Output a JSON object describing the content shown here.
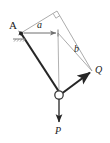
{
  "figure": {
    "type": "statics-free-body-diagram",
    "title": "",
    "colors": {
      "link_dark": "#262626",
      "construction_light": "#9a9a9a",
      "dimension_line": "#8c8c8c",
      "label_text": "#1a1a1a",
      "background": "#ffffff"
    },
    "labels": {
      "support_point": "A",
      "dimension_horizontal": "a",
      "dimension_diagonal": "b",
      "force_right": "Q",
      "force_down": "P"
    },
    "nodes": [
      {
        "name": "support-A",
        "label": "A",
        "x": 21,
        "y": 33
      },
      {
        "name": "top-vertex",
        "label": "",
        "x": 57,
        "y": 11
      },
      {
        "name": "right-vertex",
        "label": "Q",
        "x": 92,
        "y": 71
      },
      {
        "name": "pin-joint",
        "label": "",
        "x": 59,
        "y": 95
      },
      {
        "name": "corner-inner",
        "label": "",
        "x": 58,
        "y": 33
      },
      {
        "name": "force-P-tip",
        "label": "P",
        "x": 59,
        "y": 125
      }
    ],
    "members": [
      {
        "name": "link-A-to-joint",
        "from": "support-A",
        "to": "pin-joint",
        "style": "heavy"
      },
      {
        "name": "link-joint-to-Q",
        "from": "pin-joint",
        "to": "right-vertex",
        "style": "heavy-arrow"
      },
      {
        "name": "construction-A-to-top",
        "from": "support-A",
        "to": "top-vertex",
        "style": "light"
      },
      {
        "name": "construction-top-to-right",
        "from": "top-vertex",
        "to": "right-vertex",
        "style": "light"
      },
      {
        "name": "construction-vertical",
        "from": "corner-inner",
        "to": "pin-joint",
        "style": "light"
      },
      {
        "name": "dimension-b",
        "from": "corner-inner",
        "to": "right-vertex",
        "style": "light"
      }
    ],
    "dimensions": [
      {
        "name": "dimension-a",
        "label": "a",
        "from_x": 21,
        "from_y": 33,
        "to_x": 58,
        "to_y": 33,
        "arrows": "both"
      }
    ],
    "forces": [
      {
        "name": "force-Q",
        "label": "Q",
        "direction": "up-right",
        "applied_at": "pin-joint"
      },
      {
        "name": "force-P",
        "label": "P",
        "direction": "down",
        "applied_at": "pin-joint"
      }
    ]
  }
}
